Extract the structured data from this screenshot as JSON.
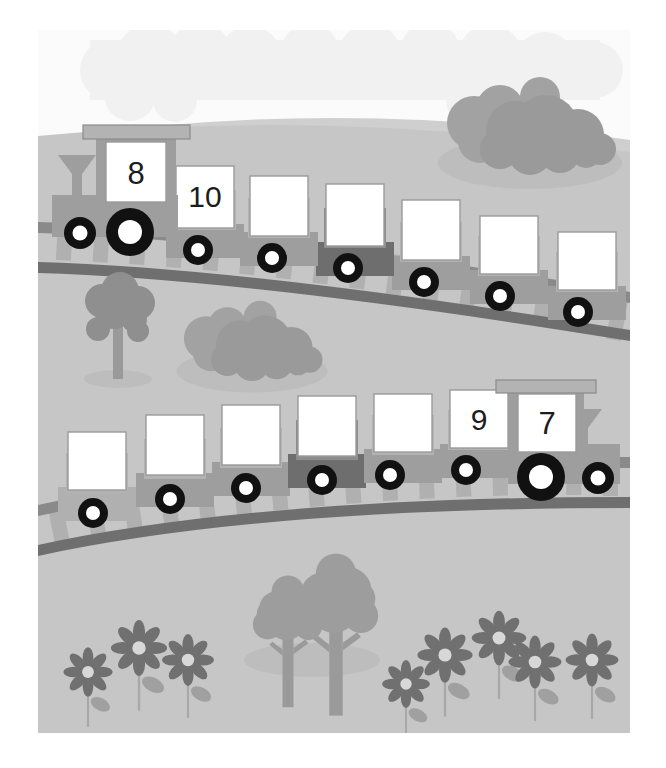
{
  "illustration": {
    "title": "Number Trains Counting Worksheet",
    "description": "Two trains on curved tracks in a grassy landscape with number cards to fill in",
    "canvas": {
      "width": 666,
      "height": 768
    },
    "frame": {
      "x": 38,
      "y": 30,
      "width": 592,
      "height": 703
    }
  },
  "palette": {
    "paper": "#ffffff",
    "sky": "#fbfbfb",
    "cloud": "#f2f2f2",
    "ground": "#c6c6c6",
    "hill_highlight": "#cfcfcf",
    "ground_shadow": "#bdbdbd",
    "train_body": "#9e9e9e",
    "train_body_dark": "#6e6e6e",
    "train_body_light": "#b3b3b3",
    "card_face": "#ffffff",
    "card_edge": "#9a9a9a",
    "wheel_tire": "#111111",
    "wheel_hub": "#ffffff",
    "rail": "#8a8a8a",
    "rail_dark": "#6f6f6f",
    "sleeper": "#b0b0b0",
    "foliage": "#8f8f8f",
    "foliage_dark": "#7d7d7d",
    "trunk": "#9a9a9a",
    "flower_petal": "#707070",
    "flower_center": "#d8d8d8",
    "stem": "#a8a8a8",
    "leaf": "#a0a0a0",
    "number_ink": "#1c1c1c"
  },
  "trains": [
    {
      "id": "top-train",
      "name": "Upper Train",
      "direction": "left",
      "locomotive": {
        "label": "8",
        "filled": true
      },
      "cars": [
        {
          "index": 1,
          "label": "10",
          "filled": true,
          "shade": "light"
        },
        {
          "index": 2,
          "label": "",
          "filled": false,
          "shade": "light"
        },
        {
          "index": 3,
          "label": "",
          "filled": false,
          "shade": "light"
        },
        {
          "index": 4,
          "label": "",
          "filled": false,
          "shade": "dark"
        },
        {
          "index": 5,
          "label": "",
          "filled": false,
          "shade": "light"
        },
        {
          "index": 6,
          "label": "",
          "filled": false,
          "shade": "light"
        },
        {
          "index": 7,
          "label": "",
          "filled": false,
          "shade": "light"
        }
      ]
    },
    {
      "id": "bottom-train",
      "name": "Lower Train",
      "direction": "right",
      "locomotive": {
        "label": "7",
        "filled": true
      },
      "cars": [
        {
          "index": 1,
          "label": "",
          "filled": false,
          "shade": "light"
        },
        {
          "index": 2,
          "label": "",
          "filled": false,
          "shade": "light"
        },
        {
          "index": 3,
          "label": "",
          "filled": false,
          "shade": "light"
        },
        {
          "index": 4,
          "label": "",
          "filled": false,
          "shade": "dark"
        },
        {
          "index": 5,
          "label": "",
          "filled": false,
          "shade": "light"
        },
        {
          "index": 6,
          "label": "9",
          "filled": true,
          "shade": "light"
        }
      ]
    }
  ],
  "numbers_visible": [
    "8",
    "10",
    "9",
    "7"
  ],
  "scenery": {
    "bushes": [
      {
        "name": "bush-upper-right",
        "x": 530,
        "y": 120
      },
      {
        "name": "bush-middle-left",
        "x": 252,
        "y": 345
      }
    ],
    "trees": [
      {
        "name": "tree-left-small",
        "x": 118,
        "y": 320
      },
      {
        "name": "tree-bottom-left",
        "x": 289,
        "y": 620
      },
      {
        "name": "tree-bottom-right",
        "x": 335,
        "y": 600
      }
    ],
    "flowers": [
      {
        "name": "flower-1",
        "x": 88,
        "y": 672
      },
      {
        "name": "flower-2",
        "x": 139,
        "y": 648
      },
      {
        "name": "flower-3",
        "x": 188,
        "y": 660
      },
      {
        "name": "flower-4",
        "x": 406,
        "y": 684
      },
      {
        "name": "flower-5",
        "x": 445,
        "y": 655
      },
      {
        "name": "flower-6",
        "x": 499,
        "y": 638
      },
      {
        "name": "flower-7",
        "x": 535,
        "y": 660
      },
      {
        "name": "flower-8",
        "x": 592,
        "y": 665
      }
    ]
  }
}
